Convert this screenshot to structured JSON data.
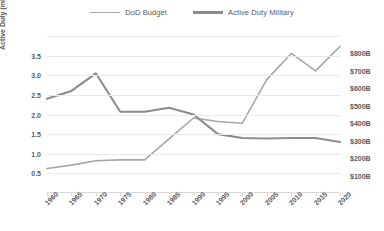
{
  "chart_data": {
    "type": "line",
    "title": "",
    "xlabel": "",
    "ylabel": "Active Duty (millions)",
    "y2label": "",
    "grid": true,
    "legend_position": "top-center",
    "x": [
      1960,
      1965,
      1970,
      1975,
      1980,
      1985,
      1990,
      1995,
      2000,
      2005,
      2010,
      2015,
      2020
    ],
    "xtick_labels": [
      "1960",
      "1965",
      "1970",
      "1975",
      "1980",
      "1985",
      "1990",
      "1995",
      "2000",
      "2005",
      "2010",
      "2015",
      "2020"
    ],
    "ylim": [
      0.0,
      4.0
    ],
    "ytick_values": [
      0.5,
      1.0,
      1.5,
      2.0,
      2.5,
      3.0,
      3.5
    ],
    "ytick_labels": [
      "0.5",
      "1.0",
      "1.5",
      "2.0",
      "2.5",
      "3.0",
      "3.5"
    ],
    "y2lim": [
      0,
      900
    ],
    "y2tick_values": [
      100,
      200,
      300,
      400,
      500,
      600,
      700,
      800
    ],
    "y2tick_labels": [
      "$100B",
      "$200B",
      "$300B",
      "$400B",
      "$500B",
      "$600B",
      "$700B",
      "$800B"
    ],
    "series": [
      {
        "name": "DoD Budget",
        "axis": "right",
        "units": "billions USD",
        "color": "#a6a6a6",
        "values": [
          140,
          160,
          185,
          190,
          190,
          310,
          430,
          410,
          400,
          650,
          800,
          700,
          840
        ]
      },
      {
        "name": "Active Duty Military",
        "axis": "left",
        "units": "millions",
        "color": "#8c8c8c",
        "values": [
          2.4,
          2.6,
          3.05,
          2.07,
          2.07,
          2.17,
          2.0,
          1.5,
          1.4,
          1.39,
          1.4,
          1.4,
          1.3
        ]
      }
    ]
  },
  "legend": {
    "items": [
      {
        "label": "DoD Budget"
      },
      {
        "label": "Active Duty Military"
      }
    ]
  },
  "axes": {
    "left_title": "Active Duty (millions)"
  }
}
